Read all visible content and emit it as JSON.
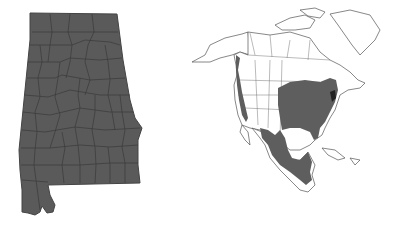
{
  "maps": [
    {
      "id": "alabama",
      "label": "Alabama county map",
      "fill_color": "#5a5a5a",
      "border_color": "#333333",
      "all_counties_shaded": true
    },
    {
      "id": "north_america",
      "label": "North America range map",
      "land_fill": "#ffffff",
      "outline_color": "#555555",
      "range_color": "#5e5e5e",
      "range_dark_color": "#222222",
      "range_regions": [
        "Pacific coast strip",
        "Eastern United States",
        "Mexico",
        "Central America"
      ]
    }
  ]
}
